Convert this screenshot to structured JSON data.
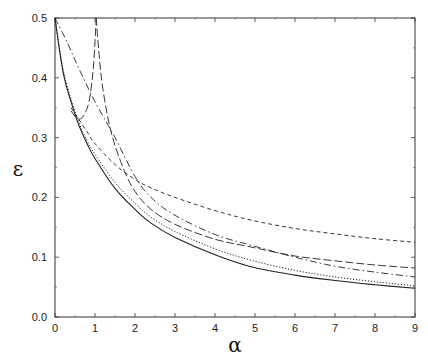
{
  "chart_data": {
    "type": "line",
    "title": "",
    "xlabel": "α",
    "ylabel": "ε",
    "xlim": [
      0,
      9
    ],
    "ylim": [
      0,
      0.5
    ],
    "xticks": [
      "0",
      "1",
      "2",
      "3",
      "4",
      "5",
      "6",
      "7",
      "8",
      "9"
    ],
    "yticks": [
      "0.0",
      "0.1",
      "0.2",
      "0.3",
      "0.4",
      "0.5"
    ],
    "grid": false,
    "legend": null,
    "series": [
      {
        "name": "solid",
        "style": "solid",
        "x": [
          0,
          0.2,
          0.4,
          0.6,
          0.8,
          1.0,
          1.5,
          2.0,
          2.4,
          3.0,
          4.0,
          4.9,
          6.0,
          7.0,
          8.0,
          9.0
        ],
        "y": [
          0.5,
          0.41,
          0.36,
          0.32,
          0.29,
          0.265,
          0.215,
          0.18,
          0.157,
          0.133,
          0.104,
          0.084,
          0.07,
          0.061,
          0.054,
          0.048
        ]
      },
      {
        "name": "dotted",
        "style": "dotted",
        "x": [
          0,
          0.2,
          0.4,
          0.6,
          0.8,
          1.0,
          1.5,
          2.0,
          2.4,
          3.0,
          4.0,
          4.9,
          6.0,
          7.0,
          8.0,
          9.0
        ],
        "y": [
          0.5,
          0.415,
          0.365,
          0.325,
          0.295,
          0.272,
          0.225,
          0.19,
          0.167,
          0.143,
          0.114,
          0.095,
          0.078,
          0.067,
          0.059,
          0.052
        ]
      },
      {
        "name": "dash-dot",
        "style": "dashdot",
        "x": [
          0,
          0.3,
          0.6,
          1.0,
          1.5,
          2.0,
          2.4,
          3.0,
          4.0,
          4.9,
          6.0,
          7.0,
          8.0,
          9.0
        ],
        "y": [
          0.5,
          0.46,
          0.415,
          0.36,
          0.3,
          0.235,
          0.2,
          0.17,
          0.138,
          0.12,
          0.1,
          0.085,
          0.075,
          0.067
        ]
      },
      {
        "name": "short-dash",
        "style": "shortdash",
        "x": [
          0.4,
          0.6,
          0.8,
          1.0,
          1.5,
          2.0,
          2.4,
          3.0,
          4.0,
          4.9,
          6.0,
          7.0,
          8.0,
          9.0
        ],
        "y": [
          0.35,
          0.33,
          0.31,
          0.29,
          0.255,
          0.23,
          0.216,
          0.2,
          0.178,
          0.162,
          0.148,
          0.139,
          0.131,
          0.125
        ]
      },
      {
        "name": "long-dash-rising",
        "style": "longdash",
        "x": [
          0.4,
          0.55,
          0.7,
          0.85,
          0.95,
          1.0,
          1.03
        ],
        "y": [
          0.345,
          0.332,
          0.335,
          0.36,
          0.41,
          0.46,
          0.5
        ]
      },
      {
        "name": "long-dash-falling",
        "style": "longdash",
        "x": [
          1.03,
          1.1,
          1.2,
          1.4,
          1.7,
          2.0,
          2.4,
          3.0,
          4.0,
          4.9,
          6.0,
          7.0,
          8.0,
          9.0
        ],
        "y": [
          0.5,
          0.44,
          0.38,
          0.31,
          0.25,
          0.21,
          0.18,
          0.155,
          0.13,
          0.117,
          0.102,
          0.094,
          0.087,
          0.082
        ]
      }
    ]
  }
}
